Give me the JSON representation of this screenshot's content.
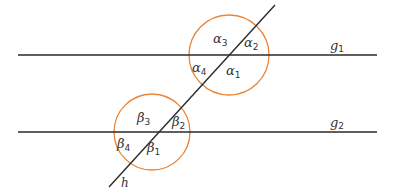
{
  "diagram": {
    "type": "parallel-lines-transversal",
    "colors": {
      "line": "#2a2a2a",
      "arc": "#e8853a",
      "text": "#333333"
    },
    "lines": {
      "g1": {
        "label_base": "g",
        "label_sub": "1"
      },
      "g2": {
        "label_base": "g",
        "label_sub": "2"
      },
      "h": {
        "label": "h"
      }
    },
    "angles_top": [
      {
        "id": "alpha1",
        "base": "α",
        "sub": "1"
      },
      {
        "id": "alpha2",
        "base": "α",
        "sub": "2"
      },
      {
        "id": "alpha3",
        "base": "α",
        "sub": "3"
      },
      {
        "id": "alpha4",
        "base": "α",
        "sub": "4"
      }
    ],
    "angles_bottom": [
      {
        "id": "beta1",
        "base": "β",
        "sub": "1"
      },
      {
        "id": "beta2",
        "base": "β",
        "sub": "2"
      },
      {
        "id": "beta3",
        "base": "β",
        "sub": "3"
      },
      {
        "id": "beta4",
        "base": "β",
        "sub": "4"
      }
    ]
  }
}
